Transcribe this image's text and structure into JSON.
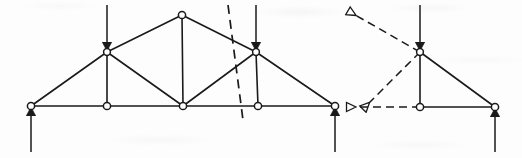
{
  "figure": {
    "width": 522,
    "height": 158,
    "background_color": "#fdfdfd",
    "ink_color": "#1a1a1a",
    "node_fill_color": "#ffffff",
    "line_width": 1.6,
    "node_radius": 3.6
  },
  "left_diagram": {
    "name": "full-truss",
    "nodes": [
      {
        "id": "L0",
        "name": "left-support-joint",
        "x": 31,
        "y": 106
      },
      {
        "id": "L1",
        "name": "lower-left-joint",
        "x": 107,
        "y": 106
      },
      {
        "id": "L2",
        "name": "lower-center-joint",
        "x": 183,
        "y": 106
      },
      {
        "id": "L3",
        "name": "lower-right-joint",
        "x": 258,
        "y": 106
      },
      {
        "id": "L4",
        "name": "right-support-joint",
        "x": 335,
        "y": 106
      },
      {
        "id": "U1",
        "name": "upper-left-joint",
        "x": 107,
        "y": 52
      },
      {
        "id": "U2",
        "name": "apex-joint",
        "x": 182,
        "y": 15
      },
      {
        "id": "U3",
        "name": "upper-right-joint",
        "x": 256,
        "y": 52
      }
    ],
    "members": [
      {
        "name": "bottom-chord-1",
        "from": "L0",
        "to": "L1"
      },
      {
        "name": "bottom-chord-2",
        "from": "L1",
        "to": "L2"
      },
      {
        "name": "bottom-chord-3",
        "from": "L2",
        "to": "L3"
      },
      {
        "name": "bottom-chord-4",
        "from": "L3",
        "to": "L4"
      },
      {
        "name": "top-chord-left-lower",
        "from": "L0",
        "to": "U1"
      },
      {
        "name": "top-chord-left-upper",
        "from": "U1",
        "to": "U2"
      },
      {
        "name": "top-chord-right-upper",
        "from": "U2",
        "to": "U3"
      },
      {
        "name": "top-chord-right-lower",
        "from": "U3",
        "to": "L4"
      },
      {
        "name": "vertical-web-left",
        "from": "U1",
        "to": "L1"
      },
      {
        "name": "vertical-web-center",
        "from": "U2",
        "to": "L2"
      },
      {
        "name": "vertical-web-right",
        "from": "U3",
        "to": "L3"
      },
      {
        "name": "diagonal-web-left",
        "from": "U1",
        "to": "L2"
      },
      {
        "name": "diagonal-web-right",
        "from": "L2",
        "to": "U3"
      }
    ],
    "applied_loads": [
      {
        "name": "load-arrow-upper-left",
        "x": 107,
        "y_tail": 5,
        "y_head": 52,
        "direction": "down",
        "style": "solid-filled"
      },
      {
        "name": "load-arrow-upper-right",
        "x": 256,
        "y_tail": 5,
        "y_head": 52,
        "direction": "down",
        "style": "solid-filled"
      }
    ],
    "reactions": [
      {
        "name": "reaction-arrow-left",
        "x": 31,
        "y_tail": 152,
        "y_head": 106,
        "direction": "up",
        "style": "solid-filled"
      },
      {
        "name": "reaction-arrow-right",
        "x": 335,
        "y_tail": 152,
        "y_head": 106,
        "direction": "up",
        "style": "solid-filled"
      }
    ],
    "section_cut": {
      "name": "section-cut-line",
      "style": "dashed",
      "x1": 228,
      "y1": 5,
      "x2": 243,
      "y2": 120,
      "dash_pattern": "9 6"
    }
  },
  "right_diagram": {
    "name": "free-body-diagram",
    "nodes": [
      {
        "id": "R_top",
        "name": "fbd-top-joint",
        "x": 420,
        "y": 52
      },
      {
        "id": "R_mid",
        "name": "fbd-bottom-center-joint",
        "x": 420,
        "y": 107
      },
      {
        "id": "R_right",
        "name": "fbd-support-joint",
        "x": 495,
        "y": 107
      }
    ],
    "members": [
      {
        "name": "fbd-vertical-member",
        "from": "R_top",
        "to": "R_mid"
      },
      {
        "name": "fbd-bottom-chord",
        "from": "R_mid",
        "to": "R_right"
      },
      {
        "name": "fbd-diagonal-member",
        "from": "R_top",
        "to": "R_right"
      }
    ],
    "applied_loads": [
      {
        "name": "fbd-load-arrow",
        "x": 420,
        "y_tail": 5,
        "y_head": 52,
        "direction": "down",
        "style": "solid-filled"
      }
    ],
    "reactions": [
      {
        "name": "fbd-reaction-arrow",
        "x": 495,
        "y_tail": 152,
        "y_head": 107,
        "direction": "up",
        "style": "solid-filled"
      }
    ],
    "internal_forces": [
      {
        "name": "cut-force-top-chord",
        "x_tail": 420,
        "y_tail": 52,
        "x_head": 364,
        "y_head": 20,
        "style": "dashed-hollow"
      },
      {
        "name": "cut-force-diagonal",
        "x_tail": 420,
        "y_tail": 52,
        "x_head": 376,
        "y_head": 96,
        "style": "dashed-hollow"
      },
      {
        "name": "cut-force-bottom-chord",
        "x_tail": 420,
        "y_tail": 107,
        "x_head": 365,
        "y_head": 107,
        "style": "dashed-hollow"
      }
    ]
  }
}
